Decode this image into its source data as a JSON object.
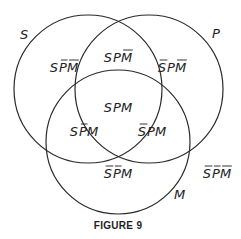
{
  "diagram": {
    "type": "venn-3",
    "sets": [
      {
        "id": "S",
        "label": "S"
      },
      {
        "id": "P",
        "label": "P"
      },
      {
        "id": "M",
        "label": "M"
      }
    ],
    "regions": [
      {
        "id": "s-only",
        "letters": [
          "S",
          "P",
          "M"
        ],
        "negated": [
          false,
          true,
          true
        ],
        "text": "SP̄M̄"
      },
      {
        "id": "sp",
        "letters": [
          "S",
          "P",
          "M"
        ],
        "negated": [
          false,
          false,
          true
        ],
        "text": "SPM̄"
      },
      {
        "id": "p-only",
        "letters": [
          "S",
          "P",
          "M"
        ],
        "negated": [
          true,
          false,
          true
        ],
        "text": "S̄PM̄"
      },
      {
        "id": "spm",
        "letters": [
          "S",
          "P",
          "M"
        ],
        "negated": [
          false,
          false,
          false
        ],
        "text": "SPM"
      },
      {
        "id": "sm",
        "letters": [
          "S",
          "P",
          "M"
        ],
        "negated": [
          false,
          true,
          false
        ],
        "text": "SP̄M"
      },
      {
        "id": "pm",
        "letters": [
          "S",
          "P",
          "M"
        ],
        "negated": [
          true,
          false,
          false
        ],
        "text": "S̄PM"
      },
      {
        "id": "m-only",
        "letters": [
          "S",
          "P",
          "M"
        ],
        "negated": [
          true,
          true,
          false
        ],
        "text": "S̄P̄M"
      },
      {
        "id": "none",
        "letters": [
          "S",
          "P",
          "M"
        ],
        "negated": [
          true,
          true,
          true
        ],
        "text": "S̄P̄M̄"
      }
    ],
    "caption": "FIGURE 9"
  }
}
